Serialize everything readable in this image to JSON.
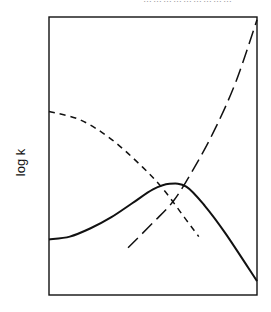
{
  "chart_data": {
    "type": "line",
    "title": "",
    "xlabel": "",
    "ylabel": "log k",
    "grid": false,
    "legend": null,
    "axis_ticks": "none",
    "x_range": [
      0,
      1
    ],
    "y_range": [
      0,
      1
    ],
    "series": [
      {
        "name": "short-dashed curve (decreasing)",
        "style": "short-dash",
        "x": [
          0.0,
          0.15,
          0.3,
          0.45,
          0.55,
          0.65,
          0.72
        ],
        "y": [
          0.66,
          0.63,
          0.56,
          0.46,
          0.38,
          0.28,
          0.21
        ]
      },
      {
        "name": "long-dashed curve (increasing)",
        "style": "long-dash",
        "x": [
          0.38,
          0.5,
          0.6,
          0.7,
          0.8,
          0.9,
          1.0
        ],
        "y": [
          0.17,
          0.26,
          0.34,
          0.46,
          0.6,
          0.77,
          0.99
        ]
      },
      {
        "name": "solid curve (resultant, peaked)",
        "style": "solid",
        "x": [
          0.0,
          0.1,
          0.2,
          0.3,
          0.4,
          0.5,
          0.58,
          0.66,
          0.75,
          0.85,
          1.0
        ],
        "y": [
          0.2,
          0.21,
          0.24,
          0.28,
          0.33,
          0.38,
          0.4,
          0.39,
          0.32,
          0.22,
          0.05
        ]
      }
    ],
    "annotations": [
      "curves cross near x≈0.58, solid peak near x≈0.62"
    ]
  },
  "axis": {
    "ylabel": "log k"
  },
  "top_text": "………………………"
}
